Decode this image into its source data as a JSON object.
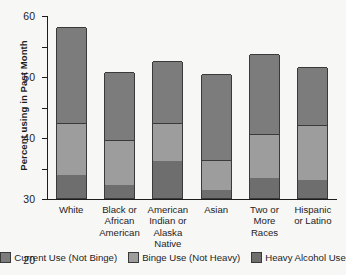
{
  "chart_data": {
    "type": "bar",
    "bar_mode": "stacked",
    "title": "",
    "xlabel": "",
    "ylabel": "Percent using in Past Month",
    "ylim": [
      0,
      60
    ],
    "yticks": [
      0,
      10,
      20,
      30,
      40,
      50,
      60
    ],
    "grid": false,
    "legend_position": "bottom",
    "categories": [
      "White",
      "Black or African American",
      "American Indian or Alaska Native",
      "Asian",
      "Two or More Races",
      "Hispanic or Latino"
    ],
    "category_lines": [
      [
        "White"
      ],
      [
        "Black or",
        "African",
        "American"
      ],
      [
        "American",
        "Indian or",
        "Alaska",
        "Native"
      ],
      [
        "Asian"
      ],
      [
        "Two or",
        "More",
        "Races"
      ],
      [
        "Hispanic",
        "or Latino"
      ]
    ],
    "series": [
      {
        "name": "Heavy Alcohol Use",
        "color": "#6e6e6e",
        "values": [
          7.5,
          4.3,
          12.0,
          2.5,
          6.5,
          6.0
        ]
      },
      {
        "name": "Binge Use (Not Heavy)",
        "color": "#9d9d9d",
        "values": [
          17.0,
          14.7,
          12.5,
          10.0,
          14.5,
          18.0
        ]
      },
      {
        "name": "Current Use (Not Binge)",
        "color": "#7c7c7c",
        "values": [
          31.5,
          22.3,
          20.5,
          28.0,
          26.3,
          19.0
        ]
      }
    ],
    "totals": [
      56.0,
      41.3,
      45.0,
      40.5,
      47.3,
      43.0
    ],
    "legend": [
      {
        "label": "Current Use (Not Binge)",
        "color": "#7c7c7c"
      },
      {
        "label": "Binge Use (Not Heavy)",
        "color": "#9d9d9d"
      },
      {
        "label": "Heavy Alcohol Use",
        "color": "#6e6e6e"
      }
    ]
  }
}
